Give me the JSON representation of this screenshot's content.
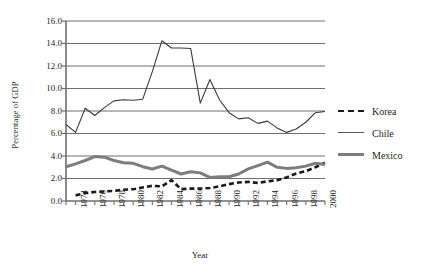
{
  "chart_data": {
    "type": "line",
    "title": "",
    "xlabel": "Year",
    "ylabel": "Percentage of GDP",
    "xlim": [
      1973,
      2000
    ],
    "ylim": [
      0.0,
      16.0
    ],
    "grid": "horizontal",
    "legend_position": "right",
    "y_ticks": [
      "0.0",
      "2.0",
      "4.0",
      "6.0",
      "8.0",
      "10.0",
      "12.0",
      "14.0",
      "16.0"
    ],
    "y_tick_values": [
      0.0,
      2.0,
      4.0,
      6.0,
      8.0,
      10.0,
      12.0,
      14.0,
      16.0
    ],
    "x_ticks": [
      "1974",
      "1976",
      "1978",
      "1980",
      "1982",
      "1984",
      "1986",
      "1988",
      "1990",
      "1992",
      "1994",
      "1996",
      "1998",
      "2000"
    ],
    "x_tick_values": [
      1974,
      1976,
      1978,
      1980,
      1982,
      1984,
      1986,
      1988,
      1990,
      1992,
      1994,
      1996,
      1998,
      2000
    ],
    "x_minor_ticks": [
      1973,
      1974,
      1975,
      1976,
      1977,
      1978,
      1979,
      1980,
      1981,
      1982,
      1983,
      1984,
      1985,
      1986,
      1987,
      1988,
      1989,
      1990,
      1991,
      1992,
      1993,
      1994,
      1995,
      1996,
      1997,
      1998,
      1999,
      2000
    ],
    "x": [
      1973,
      1974,
      1975,
      1976,
      1977,
      1978,
      1979,
      1980,
      1981,
      1982,
      1983,
      1984,
      1985,
      1986,
      1987,
      1988,
      1989,
      1990,
      1991,
      1992,
      1993,
      1994,
      1995,
      1996,
      1997,
      1998,
      1999,
      2000
    ],
    "series": [
      {
        "name": "Korea",
        "color": "#1a1a1a",
        "style": "dashed",
        "width": 2.6,
        "values": [
          null,
          0.5,
          0.7,
          0.8,
          0.85,
          0.9,
          1.0,
          1.05,
          1.2,
          1.35,
          1.3,
          1.85,
          1.05,
          1.1,
          1.1,
          1.15,
          1.3,
          1.5,
          1.65,
          1.7,
          1.6,
          1.75,
          1.85,
          2.1,
          2.45,
          2.65,
          3.0,
          3.4
        ]
      },
      {
        "name": "Chile",
        "color": "#3a3a3a",
        "style": "solid",
        "width": 1.1,
        "values": [
          6.8,
          6.1,
          8.25,
          7.6,
          8.3,
          8.9,
          9.0,
          8.95,
          9.05,
          11.5,
          14.25,
          13.6,
          13.6,
          13.55,
          8.7,
          10.8,
          9.0,
          7.85,
          7.3,
          7.4,
          6.9,
          7.1,
          6.5,
          6.1,
          6.4,
          7.0,
          7.85,
          7.95
        ]
      },
      {
        "name": "Mexico",
        "color": "#7d7d7d",
        "style": "solid",
        "width": 3.0,
        "values": [
          3.05,
          3.3,
          3.6,
          3.95,
          3.9,
          3.6,
          3.4,
          3.35,
          3.05,
          2.85,
          3.1,
          2.75,
          2.4,
          2.6,
          2.5,
          2.1,
          2.15,
          2.15,
          2.4,
          2.85,
          3.15,
          3.45,
          3.0,
          2.9,
          2.95,
          3.1,
          3.35,
          3.25
        ]
      }
    ]
  },
  "legend": {
    "items": [
      {
        "label": "Korea"
      },
      {
        "label": "Chile"
      },
      {
        "label": "Mexico"
      }
    ]
  },
  "axes": {
    "ylabel": "Percentage of GDP",
    "xlabel": "Year"
  }
}
